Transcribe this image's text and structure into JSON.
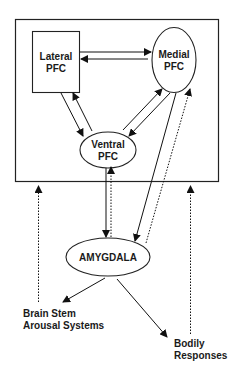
{
  "diagram": {
    "nodes": {
      "lateral_pfc": {
        "line1": "Lateral",
        "line2": "PFC",
        "shape": "rectangle"
      },
      "medial_pfc": {
        "line1": "Medial",
        "line2": "PFC",
        "shape": "ellipse"
      },
      "ventral_pfc": {
        "line1": "Ventral",
        "line2": "PFC",
        "shape": "ellipse"
      },
      "amygdala": {
        "label": "AMYGDALA",
        "shape": "ellipse"
      },
      "brain_stem": {
        "line1": "Brain Stem",
        "line2": "Arousal Systems",
        "shape": "text"
      },
      "bodily": {
        "line1": "Bodily",
        "line2": "Responses",
        "shape": "text"
      }
    },
    "container": {
      "label": "",
      "contains": [
        "lateral_pfc",
        "medial_pfc",
        "ventral_pfc"
      ]
    },
    "edges": [
      {
        "from": "lateral_pfc",
        "to": "medial_pfc",
        "style": "solid"
      },
      {
        "from": "medial_pfc",
        "to": "lateral_pfc",
        "style": "solid"
      },
      {
        "from": "lateral_pfc",
        "to": "ventral_pfc",
        "style": "solid"
      },
      {
        "from": "ventral_pfc",
        "to": "lateral_pfc",
        "style": "solid"
      },
      {
        "from": "ventral_pfc",
        "to": "medial_pfc",
        "style": "solid"
      },
      {
        "from": "medial_pfc",
        "to": "ventral_pfc",
        "style": "solid"
      },
      {
        "from": "ventral_pfc",
        "to": "amygdala",
        "style": "solid"
      },
      {
        "from": "amygdala",
        "to": "ventral_pfc",
        "style": "dotted"
      },
      {
        "from": "medial_pfc",
        "to": "amygdala",
        "style": "solid"
      },
      {
        "from": "amygdala",
        "to": "medial_pfc",
        "style": "dotted"
      },
      {
        "from": "amygdala",
        "to": "brain_stem",
        "style": "solid"
      },
      {
        "from": "amygdala",
        "to": "bodily",
        "style": "solid"
      },
      {
        "from": "brain_stem",
        "to": "container",
        "style": "dotted"
      },
      {
        "from": "bodily",
        "to": "container",
        "style": "dotted"
      }
    ]
  }
}
